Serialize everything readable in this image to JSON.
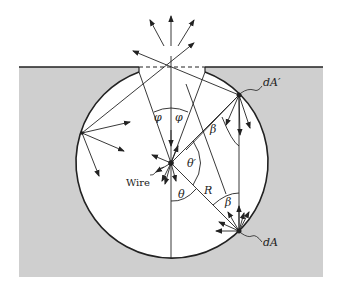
{
  "figure": {
    "type": "diagram",
    "colors": {
      "background": "#ffffff",
      "block": "#cfcfcf",
      "cavity": "#ffffff",
      "lines": "#222222"
    },
    "labels": {
      "dA_prime": "dA′",
      "dA": "dA",
      "phi_left": "φ",
      "phi_right": "φ",
      "beta_upper": "β",
      "beta_lower": "β",
      "theta_prime": "θ′",
      "theta": "θ",
      "radius": "R",
      "wire": "Wire"
    }
  }
}
